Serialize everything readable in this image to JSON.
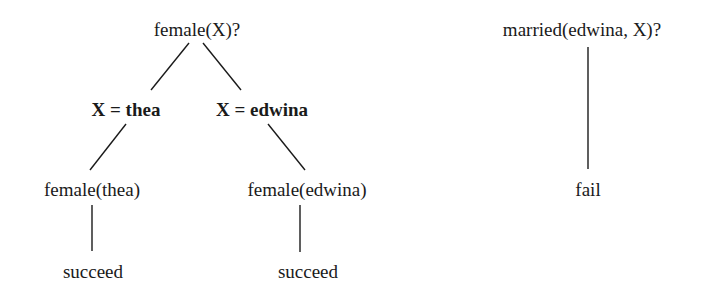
{
  "figure": {
    "kind": "prolog-search-tree",
    "background_color": "#ffffff",
    "ink_color": "#1a1a1a"
  },
  "trees": [
    {
      "id": "female-query-tree",
      "root": {
        "label": "female(X)?",
        "kind": "goal"
      },
      "bindings": [
        {
          "label": "X = thea",
          "kind": "binding"
        },
        {
          "label": "X = edwina",
          "kind": "binding"
        }
      ],
      "subgoals": [
        {
          "label": "female(thea)",
          "kind": "goal"
        },
        {
          "label": "female(edwina)",
          "kind": "goal"
        }
      ],
      "results": [
        {
          "label": "succeed",
          "kind": "result"
        },
        {
          "label": "succeed",
          "kind": "result"
        }
      ]
    },
    {
      "id": "married-query-tree",
      "root": {
        "label": "married(edwina, X)?",
        "kind": "goal"
      },
      "bindings": [],
      "subgoals": [],
      "results": [
        {
          "label": "fail",
          "kind": "result"
        }
      ]
    }
  ]
}
